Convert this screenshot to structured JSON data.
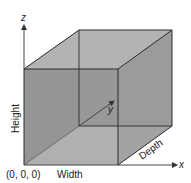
{
  "diagram": {
    "axes": {
      "x": "x",
      "y": "y",
      "z": "z"
    },
    "labels": {
      "origin": "(0, 0, 0)",
      "width": "Width",
      "height": "Height",
      "depth": "Depth"
    },
    "colors": {
      "front_face": "#8f8f8f",
      "top_face": "#b3b3b3",
      "right_face": "#9a9a9a",
      "back_face": "#a2a2a2",
      "bottom_face": "#d8d8d8",
      "edge": "#2a2a2a",
      "axis": "#333333"
    }
  }
}
